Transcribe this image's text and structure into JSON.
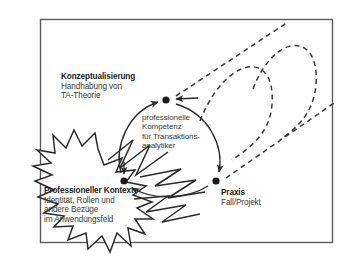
{
  "diagram": {
    "frame": {
      "name": "outer-frame"
    },
    "nodes": [
      {
        "id": "konzeptualisierung",
        "heading": "Konzeptualisierung",
        "lines": [
          "Handhabung von",
          "TA-Theorie"
        ],
        "dot": {
          "x": 166,
          "y": 100
        }
      },
      {
        "id": "professioneller-kontext",
        "heading": "Professioneller Kontext",
        "lines": [
          "Identität, Rollen und",
          "andere Bezüge",
          "im Anwendungsfeld"
        ],
        "dot": {
          "x": 124,
          "y": 181
        }
      },
      {
        "id": "praxis",
        "heading": "Praxis",
        "lines": [
          "Fall/Projekt"
        ],
        "dot": {
          "x": 216,
          "y": 181
        }
      }
    ],
    "center_label": {
      "id": "professionelle-kompetenz",
      "lines": [
        "professionelle",
        "Kompetenz",
        "für Transaktions-",
        "analytiker"
      ]
    },
    "colors": {
      "stroke": "#2b2b2b",
      "frame": "#555555",
      "text": "#2b2b2b",
      "heading": "#1a1a1a",
      "background": "#ffffff"
    }
  }
}
